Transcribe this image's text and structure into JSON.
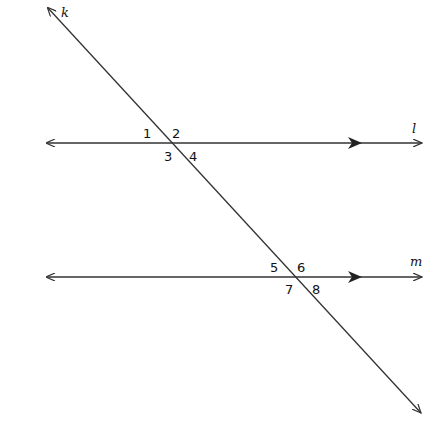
{
  "diagram": {
    "type": "parallel-lines-cut-by-transversal",
    "lines": {
      "transversal": {
        "name": "k",
        "from": [
          48,
          8
        ],
        "to": [
          421,
          413
        ]
      },
      "l": {
        "name": "l",
        "y": 143,
        "from_x": 47,
        "to_x": 422,
        "parallel_marker_x": 358
      },
      "m": {
        "name": "m",
        "y": 277,
        "from_x": 47,
        "to_x": 422,
        "parallel_marker_x": 358
      }
    },
    "angles": [
      {
        "label": "1",
        "x": 147,
        "y": 138
      },
      {
        "label": "2",
        "x": 172,
        "y": 138
      },
      {
        "label": "3",
        "x": 164,
        "y": 161
      },
      {
        "label": "4",
        "x": 190,
        "y": 161
      },
      {
        "label": "5",
        "x": 270,
        "y": 272
      },
      {
        "label": "6",
        "x": 297,
        "y": 272
      },
      {
        "label": "7",
        "x": 286,
        "y": 294
      },
      {
        "label": "8",
        "x": 313,
        "y": 294
      }
    ],
    "stroke_color": "#333333"
  }
}
